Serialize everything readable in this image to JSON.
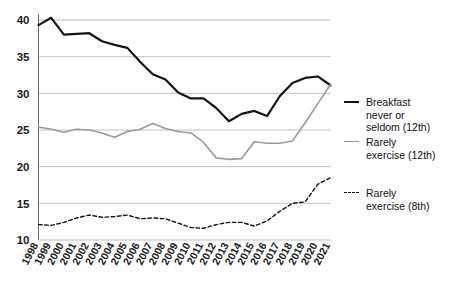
{
  "chart_data": {
    "type": "line",
    "title": "",
    "subtitle": "",
    "xlabel": "",
    "ylabel": "",
    "ylim": [
      10,
      40
    ],
    "yticks": [
      10,
      15,
      20,
      25,
      30,
      35,
      40
    ],
    "grid": true,
    "legend_position": "right",
    "x": [
      1998,
      1999,
      2000,
      2001,
      2002,
      2003,
      2004,
      2005,
      2006,
      2007,
      2008,
      2009,
      2010,
      2011,
      2012,
      2013,
      2014,
      2015,
      2016,
      2017,
      2018,
      2019,
      2020,
      2021
    ],
    "categories": [
      "1998",
      "1999",
      "2000",
      "2001",
      "2002",
      "2003",
      "2004",
      "2005",
      "2006",
      "2007",
      "2008",
      "2009",
      "2010",
      "2011",
      "2012",
      "2013",
      "2014",
      "2015",
      "2016",
      "2017",
      "2018",
      "2019",
      "2020",
      "2021"
    ],
    "series": [
      {
        "name": "Breakfast never or seldom (12th)",
        "style": "solid",
        "color": "#141414",
        "width": 2.2,
        "values": [
          39.3,
          40.3,
          38.0,
          38.1,
          38.2,
          37.1,
          36.6,
          36.2,
          34.3,
          32.6,
          31.9,
          30.1,
          29.3,
          29.3,
          28.0,
          26.2,
          27.2,
          27.6,
          26.9,
          29.6,
          31.4,
          32.1,
          32.3,
          31.1
        ]
      },
      {
        "name": "Rarely exercise (12th)",
        "style": "solid",
        "color": "#9a9a9a",
        "width": 1.6,
        "values": [
          25.4,
          25.1,
          24.7,
          25.1,
          25.0,
          24.6,
          24.0,
          24.8,
          25.1,
          25.9,
          25.2,
          24.8,
          24.6,
          23.3,
          21.2,
          21.0,
          21.1,
          23.4,
          23.2,
          23.2,
          23.5,
          26.0,
          28.6,
          31.2
        ]
      },
      {
        "name": "Rarely exercise (8th)",
        "style": "dashed",
        "color": "#141414",
        "width": 1.4,
        "values": [
          12.1,
          12.0,
          12.4,
          13.0,
          13.4,
          13.1,
          13.2,
          13.4,
          12.9,
          13.0,
          12.9,
          12.3,
          11.7,
          11.6,
          12.1,
          12.4,
          12.4,
          11.9,
          12.6,
          13.9,
          15.0,
          15.2,
          17.6,
          18.5
        ]
      }
    ]
  },
  "axes": {
    "ytick_labels": [
      "40",
      "35",
      "30",
      "25",
      "20",
      "15",
      "10"
    ],
    "xtick_labels": [
      "1998",
      "1999",
      "2000",
      "2001",
      "2002",
      "2003",
      "2004",
      "2005",
      "2006",
      "2007",
      "2008",
      "2009",
      "2010",
      "2011",
      "2012",
      "2013",
      "2014",
      "2015",
      "2016",
      "2017",
      "2018",
      "2019",
      "2020",
      "2021"
    ]
  },
  "legend": {
    "items": [
      {
        "label": "Breakfast\nnever or\nseldom (12th)",
        "style": "solid",
        "color": "#141414"
      },
      {
        "label": "Rarely\nexercise (12th)",
        "style": "solid",
        "color": "#9a9a9a"
      },
      {
        "label": "Rarely\nexercise (8th)",
        "style": "dashed",
        "color": "#141414"
      }
    ]
  },
  "colors": {
    "grid": "#b9b9b9",
    "axis": "#6e6e6e",
    "text": "#101010",
    "series_black": "#141414",
    "series_gray": "#9a9a9a"
  }
}
